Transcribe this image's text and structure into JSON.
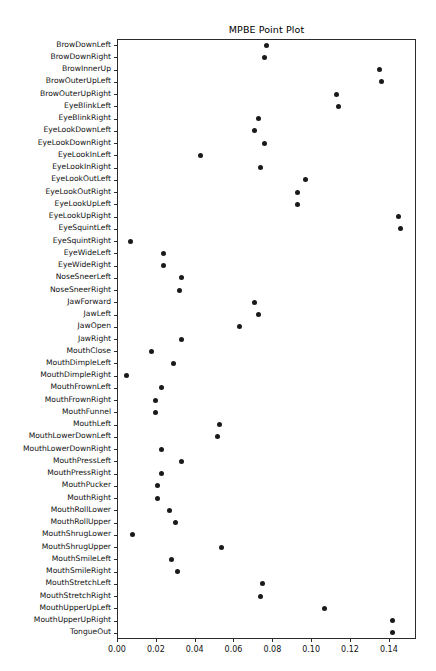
{
  "chart_data": {
    "type": "scatter",
    "title": "MPBE Point Plot",
    "xlabel": "",
    "ylabel": "",
    "xlim": [
      0.0,
      0.154
    ],
    "xticks": [
      0.0,
      0.02,
      0.04,
      0.06,
      0.08,
      0.1,
      0.12,
      0.14
    ],
    "xticklabels": [
      "0.00",
      "0.02",
      "0.04",
      "0.06",
      "0.08",
      "0.10",
      "0.12",
      "0.14"
    ],
    "grid": false,
    "legend": null,
    "marker": "circle",
    "marker_color": "#1a1a1a",
    "categories": [
      "BrowDownLeft",
      "BrowDownRight",
      "BrowInnerUp",
      "BrowOuterUpLeft",
      "BrowOuterUpRight",
      "EyeBlinkLeft",
      "EyeBlinkRight",
      "EyeLookDownLeft",
      "EyeLookDownRight",
      "EyeLookInLeft",
      "EyeLookInRight",
      "EyeLookOutLeft",
      "EyeLookOutRight",
      "EyeLookUpLeft",
      "EyeLookUpRight",
      "EyeSquintLeft",
      "EyeSquintRight",
      "EyeWideLeft",
      "EyeWideRight",
      "NoseSneerLeft",
      "NoseSneerRight",
      "JawForward",
      "JawLeft",
      "JawOpen",
      "JawRight",
      "MouthClose",
      "MouthDimpleLeft",
      "MouthDimpleRight",
      "MouthFrownLeft",
      "MouthFrownRight",
      "MouthFunnel",
      "MouthLeft",
      "MouthLowerDownLeft",
      "MouthLowerDownRight",
      "MouthPressLeft",
      "MouthPressRight",
      "MouthPucker",
      "MouthRight",
      "MouthRollLower",
      "MouthRollUpper",
      "MouthShrugLower",
      "MouthShrugUpper",
      "MouthSmileLeft",
      "MouthSmileRight",
      "MouthStretchLeft",
      "MouthStretchRight",
      "MouthUpperUpLeft",
      "MouthUpperUpRight",
      "TongueOut"
    ],
    "values": [
      0.077,
      0.076,
      0.135,
      0.136,
      0.113,
      0.114,
      0.073,
      0.071,
      0.076,
      0.043,
      0.074,
      0.097,
      0.093,
      0.093,
      0.145,
      0.146,
      0.007,
      0.024,
      0.024,
      0.033,
      0.032,
      0.071,
      0.073,
      0.063,
      0.033,
      0.018,
      0.029,
      0.005,
      0.023,
      0.02,
      0.02,
      0.053,
      0.052,
      0.023,
      0.033,
      0.023,
      0.021,
      0.021,
      0.027,
      0.03,
      0.008,
      0.054,
      0.028,
      0.031,
      0.075,
      0.074,
      0.107,
      0.142,
      0.142
    ]
  }
}
